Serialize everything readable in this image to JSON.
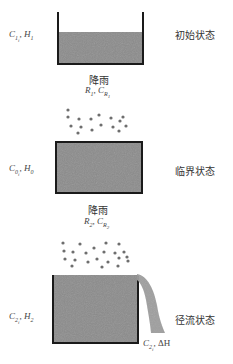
{
  "states": [
    {
      "name": "初始状态",
      "concentration": {
        "symbol": "C",
        "sub": "1",
        "subsub": "i"
      },
      "height": {
        "symbol": "H",
        "sub": "1"
      }
    },
    {
      "name": "临界状态",
      "concentration": {
        "symbol": "C",
        "sub": "0",
        "subsub": "i"
      },
      "height": {
        "symbol": "H",
        "sub": "0"
      }
    },
    {
      "name": "径流状态",
      "concentration": {
        "symbol": "C",
        "sub": "2",
        "subsub": "i"
      },
      "height": {
        "symbol": "H",
        "sub": "2"
      }
    }
  ],
  "rain_events": [
    {
      "label": "降雨",
      "rain": {
        "symbol": "R",
        "sub": "1"
      },
      "rain_conc": {
        "symbol": "C",
        "sub": "R",
        "subsub": "1"
      }
    },
    {
      "label": "降雨",
      "rain": {
        "symbol": "R",
        "sub": "2"
      },
      "rain_conc": {
        "symbol": "C",
        "sub": "R",
        "subsub": "2"
      }
    }
  ],
  "overflow": {
    "concentration": {
      "symbol": "C",
      "sub": "2",
      "subsub": "i"
    },
    "delta": "ΔH"
  },
  "separator": ", ",
  "colors": {
    "water": "#8c8c8c",
    "wall": "#1a1a1a",
    "rain_drop": "#6e6e6e"
  }
}
